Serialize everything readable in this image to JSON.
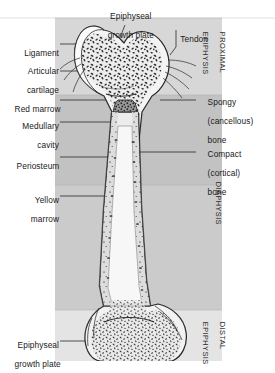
{
  "figure": {
    "colors": {
      "band_white": "#fdfdfd",
      "band_light": "#d7d7d7",
      "band_mid": "#c2c2c2",
      "band_mid2": "#cbcbcb",
      "band_pale": "#e6e6e6",
      "bone_outline": "#2b2b2b",
      "bone_fill": "#f2f2f2",
      "marrow_light": "#efefef",
      "marrow_red": "#8a8a8a",
      "leader": "#1f1f1f",
      "text": "#1a1a1a"
    },
    "panel": {
      "left": 55,
      "right": 222,
      "top": 18,
      "bottom": 361
    }
  },
  "labels": {
    "top": [
      {
        "id": "epiphyseal-growth-plate-top",
        "line1": "Epiphyseal",
        "line2": "growth plate"
      },
      {
        "id": "tendon",
        "line1": "Tendon"
      }
    ],
    "left": [
      {
        "id": "ligament",
        "line1": "Ligament",
        "line2": ""
      },
      {
        "id": "articular-cartilage",
        "line1": "Articular",
        "line2": "cartilage"
      },
      {
        "id": "red-marrow",
        "line1": "Red marrow",
        "line2": ""
      },
      {
        "id": "medullary-cavity",
        "line1": "Medullary",
        "line2": "cavity"
      },
      {
        "id": "periosteum",
        "line1": "Periosteum",
        "line2": ""
      },
      {
        "id": "yellow-marrow",
        "line1": "Yellow",
        "line2": "marrow"
      },
      {
        "id": "epiphyseal-growth-plate-bottom",
        "line1": "Epiphyseal",
        "line2": "growth plate"
      }
    ],
    "right": [
      {
        "id": "spongy-bone",
        "line1": "Spongy",
        "line2": "(cancellous)",
        "line3": "bone"
      },
      {
        "id": "compact-bone",
        "line1": "Compact",
        "line2": "(cortical)",
        "line3": "bone"
      }
    ],
    "regions": [
      {
        "id": "proximal-epiphysis",
        "line1": "PROXIMAL",
        "line2": "EPIPHYSIS"
      },
      {
        "id": "diaphysis",
        "line1": "DIAPHYSIS",
        "line2": ""
      },
      {
        "id": "distal-epiphysis",
        "line1": "DISTAL",
        "line2": "EPIPHYSIS"
      }
    ]
  }
}
